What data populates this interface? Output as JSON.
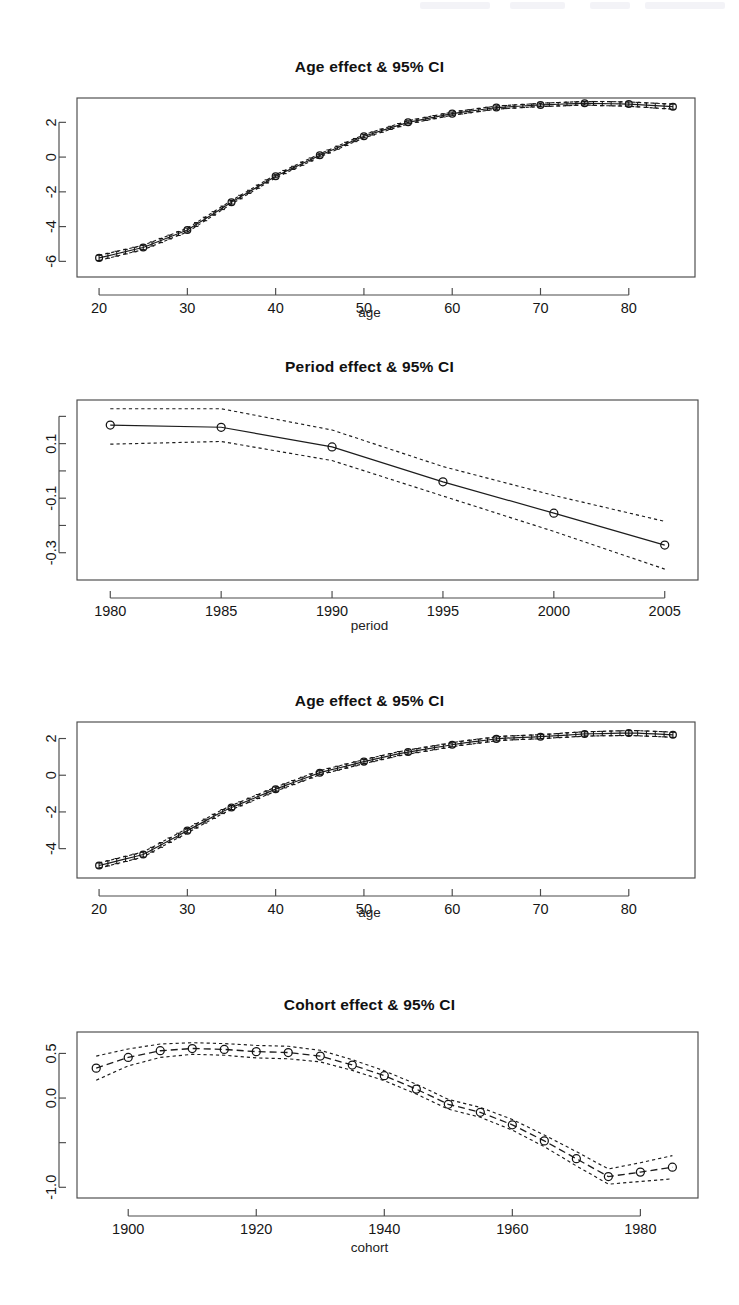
{
  "page": {
    "background": "#ffffff",
    "ink": "#1a1a1a",
    "width": 739,
    "height": 1305
  },
  "panels": [
    {
      "name": "age-effect-top",
      "title": "Age effect & 95% CI",
      "xlabel": "age",
      "ylabel": ""
    },
    {
      "name": "period-effect",
      "title": "Period effect & 95% CI",
      "xlabel": "period",
      "ylabel": ""
    },
    {
      "name": "age-effect-bottom",
      "title": "Age effect & 95% CI",
      "xlabel": "age",
      "ylabel": ""
    },
    {
      "name": "cohort-effect",
      "title": "Cohort effect & 95% CI",
      "xlabel": "cohort",
      "ylabel": ""
    }
  ],
  "chart_data": [
    {
      "type": "line",
      "name": "age-effect-top",
      "title": "Age effect & 95% CI",
      "xlabel": "age",
      "ylabel": "",
      "grid": false,
      "legend": null,
      "xticks": [
        20,
        30,
        40,
        50,
        60,
        70,
        80
      ],
      "xticklabels": [
        "20",
        "30",
        "40",
        "50",
        "60",
        "70",
        "80"
      ],
      "yticks": [
        2,
        0,
        -2,
        -4,
        -6
      ],
      "yticklabels": [
        "2",
        "0",
        "-2",
        "-4",
        "-6"
      ],
      "xlim": [
        17.5,
        87.5
      ],
      "ylim": [
        -6.9,
        3.4
      ],
      "marker_x": [
        20,
        25,
        30,
        35,
        40,
        45,
        50,
        55,
        60,
        65,
        70,
        75,
        80,
        85
      ],
      "x": [
        20,
        21,
        22,
        23,
        24,
        25,
        26,
        27,
        28,
        29,
        30,
        31,
        32,
        33,
        34,
        35,
        36,
        37,
        38,
        39,
        40,
        41,
        42,
        43,
        44,
        45,
        46,
        47,
        48,
        49,
        50,
        51,
        52,
        53,
        54,
        55,
        56,
        57,
        58,
        59,
        60,
        61,
        62,
        63,
        64,
        65,
        66,
        67,
        68,
        69,
        70,
        71,
        72,
        73,
        74,
        75,
        76,
        77,
        78,
        79,
        80,
        81,
        82,
        83,
        84,
        85
      ],
      "y": [
        -5.8,
        -5.68,
        -5.56,
        -5.44,
        -5.32,
        -5.2,
        -5.0,
        -4.8,
        -4.6,
        -4.4,
        -4.2,
        -3.88,
        -3.56,
        -3.24,
        -2.92,
        -2.6,
        -2.3,
        -2.0,
        -1.7,
        -1.4,
        -1.1,
        -0.86,
        -0.62,
        -0.38,
        -0.14,
        0.1,
        0.32,
        0.54,
        0.76,
        0.98,
        1.2,
        1.36,
        1.52,
        1.68,
        1.84,
        2.0,
        2.1,
        2.2,
        2.3,
        2.4,
        2.5,
        2.57,
        2.64,
        2.71,
        2.78,
        2.85,
        2.88,
        2.91,
        2.94,
        2.97,
        3.0,
        3.02,
        3.04,
        3.06,
        3.08,
        3.1,
        3.09,
        3.08,
        3.07,
        3.06,
        3.05,
        3.02,
        2.99,
        2.96,
        2.93,
        2.9
      ],
      "ci_lower": [
        -5.95,
        -5.82,
        -5.7,
        -5.57,
        -5.45,
        -5.33,
        -5.12,
        -4.92,
        -4.71,
        -4.51,
        -4.31,
        -3.99,
        -3.66,
        -3.34,
        -3.02,
        -2.7,
        -2.4,
        -2.09,
        -1.79,
        -1.49,
        -1.19,
        -0.95,
        -0.71,
        -0.47,
        -0.23,
        0.01,
        0.23,
        0.45,
        0.67,
        0.89,
        1.11,
        1.27,
        1.43,
        1.59,
        1.75,
        1.91,
        2.01,
        2.11,
        2.21,
        2.31,
        2.41,
        2.48,
        2.55,
        2.62,
        2.69,
        2.76,
        2.79,
        2.82,
        2.85,
        2.88,
        2.9,
        2.92,
        2.94,
        2.96,
        2.98,
        3.0,
        2.98,
        2.96,
        2.95,
        2.94,
        2.93,
        2.89,
        2.86,
        2.82,
        2.79,
        2.75
      ],
      "ci_upper": [
        -5.65,
        -5.54,
        -5.42,
        -5.31,
        -5.19,
        -5.07,
        -4.88,
        -4.68,
        -4.49,
        -4.29,
        -4.09,
        -3.77,
        -3.46,
        -3.14,
        -2.82,
        -2.5,
        -2.2,
        -1.91,
        -1.61,
        -1.31,
        -1.01,
        -0.77,
        -0.53,
        -0.29,
        -0.05,
        0.19,
        0.41,
        0.63,
        0.85,
        1.07,
        1.29,
        1.45,
        1.61,
        1.77,
        1.93,
        2.09,
        2.19,
        2.29,
        2.39,
        2.49,
        2.59,
        2.66,
        2.73,
        2.8,
        2.87,
        2.94,
        2.97,
        3.0,
        3.03,
        3.06,
        3.1,
        3.12,
        3.14,
        3.16,
        3.18,
        3.2,
        3.2,
        3.2,
        3.19,
        3.18,
        3.17,
        3.15,
        3.12,
        3.1,
        3.07,
        3.05
      ]
    },
    {
      "type": "line",
      "name": "period-effect",
      "title": "Period effect & 95% CI",
      "xlabel": "period",
      "ylabel": "",
      "grid": false,
      "legend": null,
      "xticks": [
        1980,
        1985,
        1990,
        1995,
        2000,
        2005
      ],
      "xticklabels": [
        "1980",
        "1985",
        "1990",
        "1995",
        "2000",
        "2005"
      ],
      "yticks": [
        0.2,
        0.1,
        0.0,
        -0.1,
        -0.2,
        -0.3
      ],
      "yticklabels": [
        "",
        "0.1",
        "",
        "-0.1",
        "",
        "-0.3"
      ],
      "xlim": [
        1978.5,
        2006.5
      ],
      "ylim": [
        -0.4,
        0.26
      ],
      "marker_x": [
        1980,
        1985,
        1990,
        1995,
        2000,
        2005
      ],
      "x": [
        1980,
        1985,
        1990,
        1995,
        2000,
        2005
      ],
      "y": [
        0.168,
        0.16,
        0.088,
        -0.04,
        -0.155,
        -0.272
      ],
      "ci_lower": [
        0.098,
        0.108,
        0.038,
        -0.092,
        -0.222,
        -0.36
      ],
      "ci_upper": [
        0.228,
        0.228,
        0.15,
        0.016,
        -0.09,
        -0.185
      ]
    },
    {
      "type": "line",
      "name": "age-effect-bottom",
      "title": "Age effect & 95% CI",
      "xlabel": "age",
      "ylabel": "",
      "grid": false,
      "legend": null,
      "xticks": [
        20,
        30,
        40,
        50,
        60,
        70,
        80
      ],
      "xticklabels": [
        "20",
        "30",
        "40",
        "50",
        "60",
        "70",
        "80"
      ],
      "yticks": [
        2,
        0,
        -2,
        -4
      ],
      "yticklabels": [
        "2",
        "0",
        "-2",
        "-4"
      ],
      "xlim": [
        17.5,
        87.5
      ],
      "ylim": [
        -5.6,
        2.9
      ],
      "marker_x": [
        20,
        25,
        30,
        35,
        40,
        45,
        50,
        55,
        60,
        65,
        70,
        75,
        80,
        85
      ],
      "x": [
        20,
        21,
        22,
        23,
        24,
        25,
        26,
        27,
        28,
        29,
        30,
        31,
        32,
        33,
        34,
        35,
        36,
        37,
        38,
        39,
        40,
        41,
        42,
        43,
        44,
        45,
        46,
        47,
        48,
        49,
        50,
        51,
        52,
        53,
        54,
        55,
        56,
        57,
        58,
        59,
        60,
        61,
        62,
        63,
        64,
        65,
        66,
        67,
        68,
        69,
        70,
        71,
        72,
        73,
        74,
        75,
        76,
        77,
        78,
        79,
        80,
        81,
        82,
        83,
        84,
        85
      ],
      "y": [
        -4.92,
        -4.8,
        -4.68,
        -4.56,
        -4.44,
        -4.32,
        -4.06,
        -3.8,
        -3.54,
        -3.28,
        -3.02,
        -2.76,
        -2.5,
        -2.24,
        -1.98,
        -1.76,
        -1.56,
        -1.36,
        -1.16,
        -0.96,
        -0.76,
        -0.58,
        -0.4,
        -0.22,
        -0.04,
        0.14,
        0.26,
        0.38,
        0.5,
        0.62,
        0.74,
        0.85,
        0.96,
        1.07,
        1.18,
        1.26,
        1.34,
        1.42,
        1.5,
        1.58,
        1.66,
        1.74,
        1.8,
        1.86,
        1.92,
        1.98,
        2.02,
        2.04,
        2.06,
        2.08,
        2.1,
        2.13,
        2.16,
        2.19,
        2.22,
        2.25,
        2.26,
        2.27,
        2.28,
        2.29,
        2.3,
        2.29,
        2.27,
        2.25,
        2.23,
        2.2
      ],
      "ci_lower": [
        -5.06,
        -4.94,
        -4.82,
        -4.7,
        -4.58,
        -4.46,
        -4.19,
        -3.93,
        -3.66,
        -3.4,
        -3.14,
        -2.88,
        -2.61,
        -2.35,
        -2.09,
        -1.87,
        -1.67,
        -1.47,
        -1.27,
        -1.07,
        -0.87,
        -0.69,
        -0.51,
        -0.33,
        -0.15,
        0.03,
        0.15,
        0.27,
        0.39,
        0.51,
        0.63,
        0.74,
        0.85,
        0.96,
        1.07,
        1.15,
        1.23,
        1.31,
        1.39,
        1.47,
        1.55,
        1.63,
        1.69,
        1.75,
        1.81,
        1.87,
        1.91,
        1.93,
        1.95,
        1.97,
        1.99,
        2.02,
        2.05,
        2.07,
        2.1,
        2.13,
        2.14,
        2.15,
        2.15,
        2.16,
        2.17,
        2.15,
        2.13,
        2.11,
        2.09,
        2.06
      ],
      "ci_upper": [
        -4.78,
        -4.66,
        -4.54,
        -4.42,
        -4.3,
        -4.18,
        -3.93,
        -3.67,
        -3.42,
        -3.16,
        -2.9,
        -2.64,
        -2.39,
        -2.13,
        -1.87,
        -1.65,
        -1.45,
        -1.25,
        -1.05,
        -0.85,
        -0.65,
        -0.47,
        -0.29,
        -0.11,
        0.07,
        0.25,
        0.37,
        0.49,
        0.61,
        0.73,
        0.85,
        0.96,
        1.07,
        1.18,
        1.29,
        1.37,
        1.45,
        1.53,
        1.61,
        1.69,
        1.77,
        1.85,
        1.91,
        1.97,
        2.03,
        2.09,
        2.13,
        2.15,
        2.17,
        2.19,
        2.21,
        2.24,
        2.27,
        2.31,
        2.34,
        2.37,
        2.38,
        2.39,
        2.41,
        2.42,
        2.43,
        2.43,
        2.41,
        2.39,
        2.37,
        2.34
      ]
    },
    {
      "type": "line",
      "name": "cohort-effect",
      "title": "Cohort effect & 95% CI",
      "xlabel": "cohort",
      "ylabel": "",
      "grid": false,
      "legend": null,
      "xticks": [
        1900,
        1920,
        1940,
        1960,
        1980
      ],
      "xticklabels": [
        "1900",
        "1920",
        "1940",
        "1960",
        "1980"
      ],
      "yticks": [
        0.5,
        0.0,
        -0.5,
        -1.0
      ],
      "yticklabels": [
        "0.5",
        "0.0",
        "",
        "-1.0"
      ],
      "xlim": [
        1892,
        1989
      ],
      "ylim": [
        -1.12,
        0.74
      ],
      "marker_x": [
        1895,
        1900,
        1905,
        1910,
        1915,
        1920,
        1925,
        1930,
        1935,
        1940,
        1945,
        1950,
        1955,
        1960,
        1965,
        1970,
        1975,
        1980,
        1985
      ],
      "x": [
        1895,
        1900,
        1905,
        1910,
        1915,
        1920,
        1925,
        1930,
        1935,
        1940,
        1945,
        1950,
        1955,
        1960,
        1965,
        1970,
        1975,
        1980,
        1985
      ],
      "y": [
        0.335,
        0.455,
        0.53,
        0.555,
        0.545,
        0.52,
        0.51,
        0.47,
        0.37,
        0.25,
        0.1,
        -0.07,
        -0.16,
        -0.3,
        -0.48,
        -0.68,
        -0.88,
        -0.83,
        -0.775
      ],
      "ci_lower": [
        0.2,
        0.36,
        0.455,
        0.49,
        0.48,
        0.45,
        0.44,
        0.405,
        0.31,
        0.195,
        0.045,
        -0.125,
        -0.215,
        -0.36,
        -0.545,
        -0.76,
        -0.965,
        -0.935,
        -0.905
      ],
      "ci_upper": [
        0.47,
        0.55,
        0.605,
        0.62,
        0.61,
        0.59,
        0.58,
        0.535,
        0.43,
        0.305,
        0.155,
        -0.015,
        -0.105,
        -0.24,
        -0.415,
        -0.6,
        -0.795,
        -0.725,
        -0.645
      ]
    }
  ]
}
